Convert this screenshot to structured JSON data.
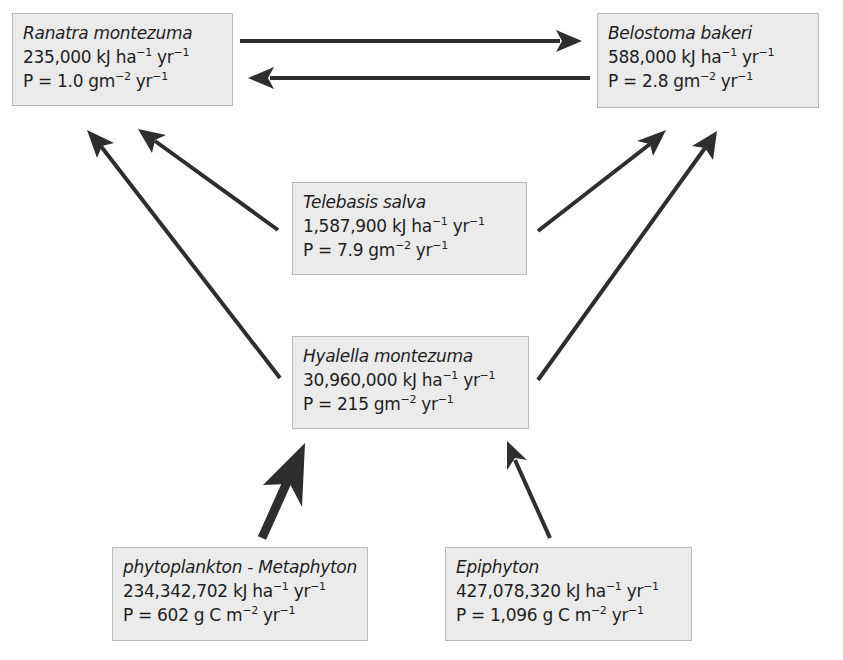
{
  "diagram": {
    "type": "food-web",
    "nodes": [
      {
        "id": "ranatra",
        "name": "Ranatra montezuma",
        "energy": "235,000",
        "energy_unit": "kJ ha",
        "production": "P = 1.0",
        "production_unit": "gm"
      },
      {
        "id": "belostoma",
        "name": "Belostoma bakeri",
        "energy": "588,000",
        "energy_unit": "kJ ha",
        "production": "P = 2.8",
        "production_unit": "gm"
      },
      {
        "id": "telebasis",
        "name": "Telebasis salva",
        "energy": "1,587,900",
        "energy_unit": "kJ ha",
        "production": "P = 7.9",
        "production_unit": "gm"
      },
      {
        "id": "hyalella",
        "name": "Hyalella montezuma",
        "energy": "30,960,000",
        "energy_unit": "kJ ha",
        "production": "P = 215",
        "production_unit": "gm"
      },
      {
        "id": "phytoplankton",
        "name": "phytoplankton - Metaphyton",
        "energy": "234,342,702",
        "energy_unit": "kJ ha",
        "production": "P = 602",
        "production_unit": "g C m"
      },
      {
        "id": "epiphyton",
        "name": "Epiphyton",
        "energy": "427,078,320",
        "energy_unit": "kJ ha",
        "production": "P = 1,096",
        "production_unit": "g C m"
      }
    ],
    "units": {
      "exp_neg1": "−1",
      "exp_neg2": "−2",
      "yr": "yr"
    },
    "edges": [
      {
        "from": "ranatra",
        "to": "belostoma",
        "weight": "normal"
      },
      {
        "from": "belostoma",
        "to": "ranatra",
        "weight": "normal"
      },
      {
        "from": "telebasis",
        "to": "ranatra",
        "weight": "normal"
      },
      {
        "from": "hyalella",
        "to": "ranatra",
        "weight": "normal"
      },
      {
        "from": "telebasis",
        "to": "belostoma",
        "weight": "normal"
      },
      {
        "from": "hyalella",
        "to": "belostoma",
        "weight": "normal"
      },
      {
        "from": "phytoplankton",
        "to": "hyalella",
        "weight": "thick"
      },
      {
        "from": "epiphyton",
        "to": "hyalella",
        "weight": "normal"
      }
    ],
    "colors": {
      "box_fill": "#ebebeb",
      "box_border": "#b9b9b9",
      "arrow": "#2e2e2e",
      "text": "#1e1e1e"
    }
  }
}
